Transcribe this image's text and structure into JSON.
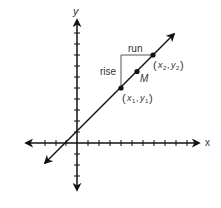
{
  "diagram": {
    "type": "coordinate-plane-slope",
    "axes": {
      "x_label": "x",
      "y_label": "y"
    },
    "labels": {
      "rise": "rise",
      "run": "run",
      "midpoint": "M",
      "point1": {
        "open": "(",
        "x": "x",
        "x_sub": "1",
        "comma": ",",
        "y": "y",
        "y_sub": "1",
        "close": ")"
      },
      "point2": {
        "open": "(",
        "x": "x",
        "x_sub": "2",
        "comma": ",",
        "y": "y",
        "y_sub": "2",
        "close": ")"
      }
    },
    "colors": {
      "line": "#111111",
      "text": "#333333",
      "background": "#ffffff"
    }
  }
}
